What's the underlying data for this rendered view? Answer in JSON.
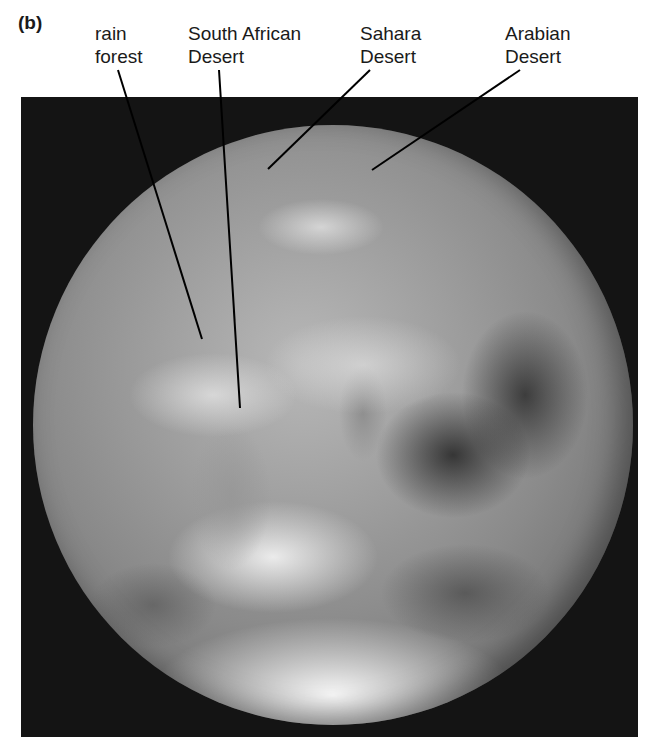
{
  "figure": {
    "panel_letter": "(b)",
    "image_description": "Black-and-white photograph of Earth from space showing Africa and the Arabian Peninsula",
    "labels": [
      {
        "id": "rain-forest",
        "lines": [
          "rain",
          "forest"
        ]
      },
      {
        "id": "south-african-desert",
        "lines": [
          "South African",
          "Desert"
        ]
      },
      {
        "id": "sahara-desert",
        "lines": [
          "Sahara",
          "Desert"
        ]
      },
      {
        "id": "arabian-desert",
        "lines": [
          "Arabian",
          "Desert"
        ]
      }
    ]
  }
}
